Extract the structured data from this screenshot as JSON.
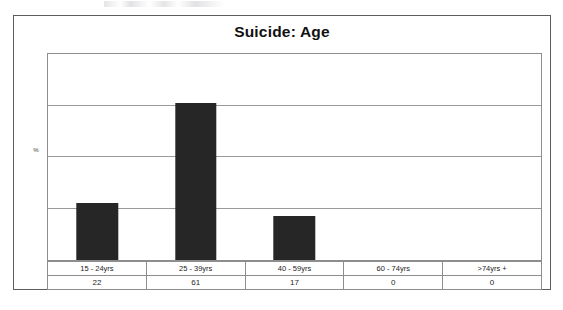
{
  "chart_data": {
    "type": "bar",
    "title": "Suicide: Age",
    "xlabel": "",
    "ylabel": "%",
    "categories": [
      "15 - 24yrs",
      "25 - 39yrs",
      "40 - 59yrs",
      "60 - 74yrs",
      ">74yrs +"
    ],
    "values": [
      22,
      61,
      17,
      0,
      0
    ],
    "ylim": [
      0,
      80
    ],
    "yticks": [
      0,
      20,
      40,
      60,
      80
    ],
    "gridlines": true,
    "grid_axis": "y",
    "tick_labels_visible": false,
    "legend": false,
    "bar_color": "#262626",
    "plot_border_color": "#8d8d8d",
    "frame_border_color": "#5d5d5d",
    "table": {
      "row_labels": [
        "15 - 24yrs",
        "25 - 39yrs",
        "40 - 59yrs",
        "60 - 74yrs",
        ">74yrs +"
      ],
      "row_values": [
        "22",
        "61",
        "17",
        "0",
        "0"
      ]
    }
  }
}
